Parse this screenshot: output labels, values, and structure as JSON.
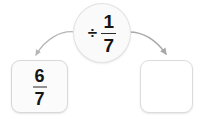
{
  "canvas": {
    "width": 203,
    "height": 119,
    "background_color": "#ffffff"
  },
  "problem": {
    "type": "fraction-division",
    "statement": "6/7 ÷ 1/7 = ?",
    "left_operand": {
      "numerator": "6",
      "denominator": "7"
    },
    "operator": {
      "symbol": "÷",
      "operand": {
        "numerator": "1",
        "denominator": "7"
      }
    },
    "answer": {
      "value": "",
      "placeholder": ""
    }
  },
  "arrows": {
    "left": {
      "label": "arrow from left fraction to operator",
      "color": "#b5b5b5"
    },
    "right": {
      "label": "arrow from operator to answer box",
      "color": "#a8a8a8"
    }
  },
  "colors": {
    "text": "#151515",
    "card_fill": "#fbfbfb",
    "card_border": "#d8d8d8",
    "oval_fill": "#fafafa",
    "oval_border": "#e2e2e2",
    "arrow": "#b0b0b0"
  }
}
